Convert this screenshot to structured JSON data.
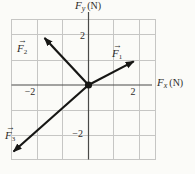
{
  "figure": {
    "type": "vector-diagram",
    "y_axis": {
      "symbol": "F",
      "subscript": "y",
      "unit": "(N)"
    },
    "x_axis": {
      "symbol": "F",
      "subscript": "x",
      "unit": "(N)"
    },
    "x_ticks": [
      {
        "label": "−2",
        "value": -2
      },
      {
        "label": "2",
        "value": 2
      }
    ],
    "y_ticks": [
      {
        "label": "2",
        "value": 2
      },
      {
        "label": "−2",
        "value": -2
      }
    ],
    "notation": {
      "vector_arrow": "→"
    },
    "vectors": [
      {
        "name": "F1",
        "symbol": "F",
        "subscript": "1",
        "from": [
          0,
          0
        ],
        "to": [
          1.78,
          0.93
        ]
      },
      {
        "name": "F2",
        "symbol": "F",
        "subscript": "2",
        "from": [
          0,
          0
        ],
        "to": [
          -1.73,
          1.85
        ]
      },
      {
        "name": "F3",
        "symbol": "F",
        "subscript": "3",
        "from": [
          0,
          0
        ],
        "to": [
          -2.95,
          -2.62
        ]
      }
    ],
    "grid": {
      "units_per_cell": 1,
      "origin_px": [
        88.5,
        85
      ],
      "unit_px": 25.4,
      "xmin": -3,
      "xmax": 2.65,
      "ymin": -2.95,
      "ymax": 2.6
    },
    "colors": {
      "grid": "#c6c6c4",
      "axis": "#4a4a48",
      "vector": "#161614",
      "text": "#2e2c2a",
      "background": "#fbfbf8"
    }
  }
}
